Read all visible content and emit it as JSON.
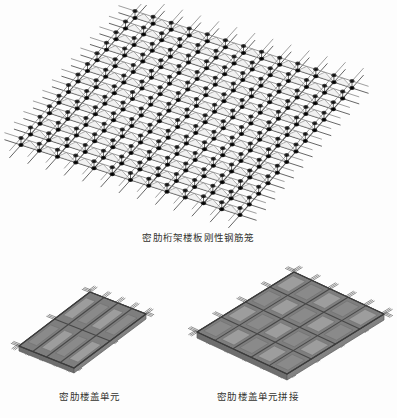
{
  "page": {
    "background_color": "#fdfdfd",
    "width": 397,
    "height": 418,
    "text_color": "#33332f"
  },
  "figures": [
    {
      "id": "main",
      "name": "dense-rib-truss-slab-rigid-rebar-cage",
      "caption": "密肋桁架楼板刚性钢筋笼",
      "type": "isometric-rebar-mesh",
      "grid": {
        "cols": 12,
        "rows": 12
      },
      "colors": {
        "bar": "#4a4a4a",
        "bar_light": "#8d8d8d",
        "node": "#1f1f1f",
        "highlight": "#e8e8e8"
      },
      "has_protruding_bars": true,
      "has_panel_fill": false
    },
    {
      "id": "unit",
      "name": "dense-rib-floor-unit",
      "caption": "密肋楼盖单元",
      "type": "isometric-panel",
      "grid": {
        "cols": 4,
        "rows": 2
      },
      "colors": {
        "fill": "#9d9d9d",
        "fill_dark": "#8a8a8a",
        "edge": "#5b5b5b",
        "bar": "#555555"
      },
      "has_protruding_bars": true,
      "has_panel_fill": true
    },
    {
      "id": "assembly",
      "name": "dense-rib-floor-unit-splice",
      "caption": "密肋楼盖单元拼接",
      "type": "isometric-panel-assembly",
      "grid": {
        "cols": 5,
        "rows": 4
      },
      "colors": {
        "fill": "#9d9d9d",
        "fill_dark": "#8a8a8a",
        "edge": "#5b5b5b",
        "bar": "#555555"
      },
      "has_protruding_bars": true,
      "has_panel_fill": true
    }
  ],
  "chart_data": {
    "type": "table",
    "title": "密肋桁架楼板刚性钢筋笼",
    "categories": [
      "密肋桁架楼板刚性钢筋笼",
      "密肋楼盖单元",
      "密肋楼盖单元拼接"
    ],
    "values": [
      144,
      8,
      20
    ],
    "xlabel": "",
    "ylabel": "网格单元数"
  }
}
